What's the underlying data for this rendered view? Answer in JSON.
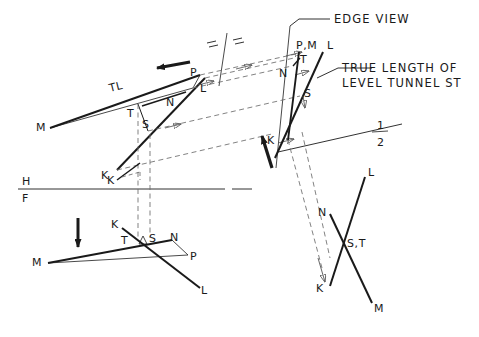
{
  "drawing": {
    "title": "Descriptive geometry: edge view and true length of level tunnel ST",
    "background_color": "#ffffff",
    "ink_color": "#1a1a1a",
    "annotations": {
      "edge_view": "EDGE VIEW",
      "true_length_line1": "TRUE LENGTH OF",
      "true_length_line2": "LEVEL TUNNEL ST",
      "true_length_mark": "TL"
    },
    "fold_lines": {
      "hf_top": "H",
      "hf_bottom": "F",
      "aux_top": "1",
      "aux_bottom": "2"
    },
    "views": {
      "top_view": {
        "name": "top-view",
        "points": [
          {
            "label": "M",
            "x": 40,
            "y": 127
          },
          {
            "label": "TL",
            "x": 116,
            "y": 88
          },
          {
            "label": "P",
            "x": 193,
            "y": 72
          },
          {
            "label": "L",
            "x": 203,
            "y": 87
          },
          {
            "label": "N",
            "x": 170,
            "y": 102
          },
          {
            "label": "T",
            "x": 131,
            "y": 113
          },
          {
            "label": "S",
            "x": 145,
            "y": 124
          },
          {
            "label": "K",
            "x": 105,
            "y": 175
          }
        ]
      },
      "auxiliary_view": {
        "name": "auxiliary-edge-view",
        "points": [
          {
            "label": "P,M",
            "x": 300,
            "y": 45
          },
          {
            "label": "L",
            "x": 330,
            "y": 45
          },
          {
            "label": "T",
            "x": 303,
            "y": 59
          },
          {
            "label": "N",
            "x": 283,
            "y": 73
          },
          {
            "label": "S",
            "x": 307,
            "y": 93
          },
          {
            "label": "K",
            "x": 270,
            "y": 140
          }
        ]
      },
      "front_view": {
        "name": "front-view",
        "points": [
          {
            "label": "M",
            "x": 36,
            "y": 262
          },
          {
            "label": "K",
            "x": 115,
            "y": 224
          },
          {
            "label": "T",
            "x": 125,
            "y": 240
          },
          {
            "label": "S",
            "x": 152,
            "y": 238
          },
          {
            "label": "N",
            "x": 173,
            "y": 237
          },
          {
            "label": "P",
            "x": 193,
            "y": 256
          },
          {
            "label": "L",
            "x": 204,
            "y": 290
          }
        ]
      },
      "auxiliary_view_2": {
        "name": "auxiliary-view-2",
        "points": [
          {
            "label": "L",
            "x": 370,
            "y": 172
          },
          {
            "label": "N",
            "x": 322,
            "y": 212
          },
          {
            "label": "S,T",
            "x": 349,
            "y": 243
          },
          {
            "label": "K",
            "x": 320,
            "y": 288
          },
          {
            "label": "M",
            "x": 377,
            "y": 308
          }
        ]
      }
    }
  }
}
